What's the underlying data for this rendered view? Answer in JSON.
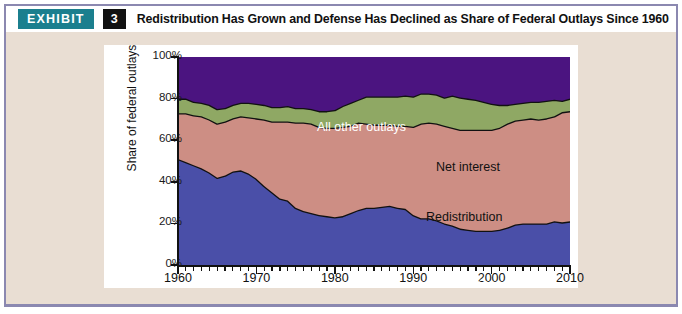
{
  "header": {
    "exhibit_label": "EXHIBIT",
    "exhibit_number": "3",
    "title": "Redistribution Has Grown and Defense Has Declined as Share of Federal Outlays Since 1960"
  },
  "colors": {
    "badge_teal": "#1b7f8e",
    "number_black": "#111111",
    "page_beige": "#e9ded3",
    "frame_purple": "#8b88b0",
    "defense_blue": "#4a4fa8",
    "redistribution_salmon": "#cd8e84",
    "net_interest_green": "#8fa864",
    "all_other_purple": "#4b1480",
    "outline_black": "#111111",
    "panel_white": "#ffffff"
  },
  "chart_data": {
    "type": "area",
    "stacked": true,
    "percent_stacked": true,
    "title": "",
    "xlabel": "",
    "ylabel": "Share of federal outlays",
    "xlim": [
      1960,
      2010
    ],
    "ylim": [
      0,
      100
    ],
    "grid": false,
    "legend_position": "in-chart-labels",
    "x_tick_labels": [
      "1960",
      "1970",
      "1980",
      "1990",
      "2000",
      "2010"
    ],
    "x_tick_values": [
      1960,
      1970,
      1980,
      1990,
      2000,
      2010
    ],
    "x_minor_tick_interval": 1,
    "y_tick_labels": [
      "0%",
      "20%",
      "40%",
      "60%",
      "80%",
      "100%"
    ],
    "y_tick_values": [
      0,
      20,
      40,
      60,
      80,
      100
    ],
    "x": [
      1960,
      1961,
      1962,
      1963,
      1964,
      1965,
      1966,
      1967,
      1968,
      1969,
      1970,
      1971,
      1972,
      1973,
      1974,
      1975,
      1976,
      1977,
      1978,
      1979,
      1980,
      1981,
      1982,
      1983,
      1984,
      1985,
      1986,
      1987,
      1988,
      1989,
      1990,
      1991,
      1992,
      1993,
      1994,
      1995,
      1996,
      1997,
      1998,
      1999,
      2000,
      2001,
      2002,
      2003,
      2004,
      2005,
      2006,
      2007,
      2008,
      2009,
      2010
    ],
    "series": [
      {
        "name": "Defense",
        "color": "#4a4fa8",
        "label_text": "Defense",
        "label_color": "#ffffff",
        "values": [
          51.0,
          49.5,
          48.0,
          46.5,
          44.5,
          42.0,
          43.0,
          45.0,
          45.5,
          44.0,
          41.5,
          38.0,
          35.0,
          32.0,
          31.0,
          27.5,
          26.0,
          25.0,
          24.0,
          23.5,
          23.0,
          23.5,
          25.0,
          26.5,
          27.5,
          27.5,
          28.0,
          28.5,
          27.5,
          27.0,
          24.0,
          22.5,
          22.5,
          21.5,
          20.0,
          19.0,
          17.5,
          17.0,
          16.5,
          16.5,
          16.5,
          17.0,
          18.0,
          19.5,
          20.0,
          20.0,
          20.0,
          20.0,
          21.0,
          20.5,
          21.0
        ]
      },
      {
        "name": "Redistribution",
        "color": "#cd8e84",
        "label_text": "Redistribution",
        "label_color": "#111111",
        "values": [
          22.0,
          23.5,
          24.0,
          25.0,
          25.5,
          26.0,
          26.0,
          25.5,
          26.0,
          27.0,
          29.0,
          32.0,
          34.0,
          37.0,
          38.0,
          41.0,
          42.5,
          43.0,
          42.5,
          42.5,
          43.0,
          43.0,
          42.0,
          42.0,
          40.5,
          40.0,
          39.5,
          39.0,
          39.5,
          40.0,
          42.5,
          45.5,
          46.0,
          46.5,
          47.0,
          47.0,
          47.5,
          48.0,
          48.5,
          48.5,
          48.5,
          49.0,
          50.0,
          50.0,
          50.0,
          50.5,
          50.0,
          50.5,
          50.5,
          53.0,
          53.0
        ]
      },
      {
        "name": "Net interest",
        "color": "#8fa864",
        "label_text": "Net interest",
        "label_color": "#111111",
        "values": [
          7.0,
          7.0,
          6.5,
          6.5,
          7.0,
          7.0,
          6.5,
          6.5,
          6.5,
          7.0,
          7.0,
          7.0,
          7.0,
          7.0,
          7.5,
          7.0,
          7.0,
          7.0,
          7.5,
          8.0,
          8.5,
          10.0,
          11.0,
          11.0,
          13.0,
          13.5,
          13.5,
          13.5,
          14.0,
          14.5,
          14.5,
          14.5,
          14.0,
          14.0,
          13.5,
          15.5,
          15.5,
          15.0,
          14.5,
          13.5,
          12.5,
          11.0,
          9.0,
          8.0,
          8.0,
          8.0,
          8.5,
          8.5,
          8.0,
          5.5,
          6.0
        ]
      },
      {
        "name": "All other outlays",
        "color": "#4b1480",
        "label_text": "All other outlays",
        "label_color": "#ffffff",
        "values": [
          20.0,
          20.0,
          21.5,
          22.0,
          23.0,
          25.0,
          24.5,
          23.0,
          22.0,
          22.0,
          22.5,
          23.0,
          24.0,
          24.0,
          23.5,
          24.5,
          24.5,
          25.0,
          26.0,
          26.0,
          25.5,
          23.5,
          22.0,
          20.5,
          19.0,
          19.0,
          19.0,
          19.0,
          19.0,
          18.5,
          19.0,
          17.5,
          17.5,
          18.0,
          19.5,
          18.5,
          19.5,
          20.0,
          20.5,
          21.5,
          22.5,
          23.0,
          23.0,
          22.5,
          22.0,
          21.5,
          21.5,
          21.0,
          20.5,
          21.0,
          20.0
        ]
      }
    ]
  },
  "source": {
    "text": ""
  }
}
